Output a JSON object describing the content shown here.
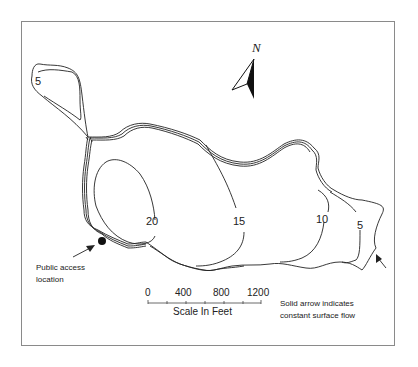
{
  "map": {
    "north_label": "N",
    "contours": [
      {
        "label": "5",
        "x": 34,
        "y": 72
      },
      {
        "label": "20",
        "x": 145,
        "y": 214
      },
      {
        "label": "15",
        "x": 233,
        "y": 214
      },
      {
        "label": "10",
        "x": 316,
        "y": 212
      },
      {
        "label": "5",
        "x": 356,
        "y": 218
      }
    ],
    "public_access": {
      "label_line1": "Public access",
      "label_line2": "location"
    },
    "flow_note": {
      "line1": "Solid arrow indicates",
      "line2": "constant surface flow"
    },
    "scale": {
      "ticks": [
        "0",
        "400",
        "800",
        "1200"
      ],
      "title": "Scale In Feet"
    },
    "colors": {
      "line": "#222222",
      "frame": "#8a8a8a"
    }
  }
}
